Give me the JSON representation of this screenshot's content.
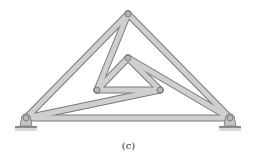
{
  "figure": {
    "caption": "(c)",
    "type": "truss",
    "colors": {
      "member_fill": "#c9c9c9",
      "member_edge": "#7a7a7a",
      "joint": "#b5b5b5",
      "ground": "#9a9a9a"
    },
    "joints": {
      "A": [
        26,
        118
      ],
      "B": [
        230,
        118
      ],
      "C": [
        128,
        14
      ],
      "D": [
        128,
        58
      ],
      "E": [
        97,
        90
      ],
      "F": [
        160,
        90
      ]
    },
    "members": [
      [
        "A",
        "C"
      ],
      [
        "C",
        "B"
      ],
      [
        "A",
        "B"
      ],
      [
        "C",
        "E"
      ],
      [
        "E",
        "D"
      ],
      [
        "D",
        "F"
      ],
      [
        "E",
        "F"
      ],
      [
        "A",
        "F"
      ],
      [
        "D",
        "B"
      ]
    ],
    "supports": [
      {
        "joint": "A",
        "type": "pin"
      },
      {
        "joint": "B",
        "type": "roller"
      }
    ]
  }
}
